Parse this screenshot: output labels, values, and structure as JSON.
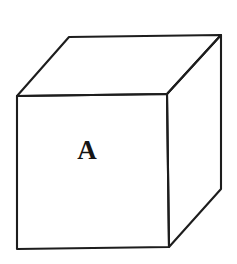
{
  "figure": {
    "background_color": "#ffffff",
    "width": 237,
    "height": 264
  },
  "shape": {
    "name": "cube",
    "type": "isometric-cube-line-drawing",
    "stroke_color": "#1d1d1d",
    "stroke_width": 2.1,
    "fill_color": "#ffffff",
    "vertices": {
      "front_top_left": [
        17,
        96
      ],
      "front_top_right": [
        167,
        94
      ],
      "front_bottom_right": [
        169,
        247
      ],
      "front_bottom_left": [
        17,
        249
      ],
      "back_top_left": [
        69,
        37
      ],
      "back_top_right": [
        221,
        35
      ],
      "back_bottom_right": [
        221,
        189
      ]
    },
    "faces": [
      {
        "id": "front",
        "label": "A",
        "points": "17,96 167,94 169,247 17,249"
      },
      {
        "id": "top",
        "label": "",
        "points": "17,96 69,37 221,35 167,94"
      },
      {
        "id": "right",
        "label": "",
        "points": "167,94 221,35 221,189 169,247"
      }
    ]
  },
  "labels": {
    "front_face": {
      "text": "A",
      "x": 87,
      "y": 159,
      "font_size": 27,
      "color": "#151515"
    }
  }
}
